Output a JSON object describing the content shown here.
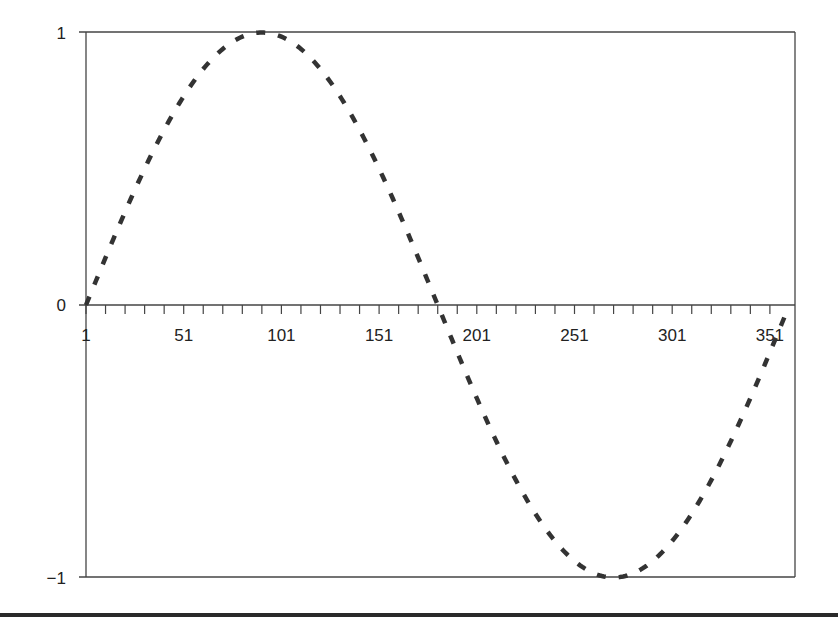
{
  "chart_data": {
    "type": "line",
    "title": "",
    "xlabel": "",
    "ylabel": "",
    "x_tick_labels": [
      "1",
      "51",
      "101",
      "151",
      "201",
      "251",
      "301",
      "351"
    ],
    "y_tick_labels": [
      "1",
      "0",
      "−1"
    ],
    "ylim": [
      -1,
      1
    ],
    "xlim": [
      1,
      360
    ],
    "grid": false,
    "legend": null,
    "series": [
      {
        "name": "sin(x°)",
        "style": "dashed",
        "color": "#333333",
        "x_start": 1,
        "x_end": 360,
        "step": 1,
        "formula": "sin((x-1) * pi / 180)",
        "sample_points": [
          {
            "x": 1,
            "y": 0.0
          },
          {
            "x": 31,
            "y": 0.5
          },
          {
            "x": 61,
            "y": 0.87
          },
          {
            "x": 91,
            "y": 1.0
          },
          {
            "x": 121,
            "y": 0.87
          },
          {
            "x": 151,
            "y": 0.5
          },
          {
            "x": 181,
            "y": 0.0
          },
          {
            "x": 211,
            "y": -0.5
          },
          {
            "x": 241,
            "y": -0.87
          },
          {
            "x": 271,
            "y": -1.0
          },
          {
            "x": 301,
            "y": -0.87
          },
          {
            "x": 331,
            "y": -0.5
          },
          {
            "x": 360,
            "y": -0.02
          }
        ]
      }
    ]
  },
  "colors": {
    "axis": "#444444",
    "line": "#333333",
    "background": "#ffffff",
    "bottom_band": "#2a2a2a"
  }
}
